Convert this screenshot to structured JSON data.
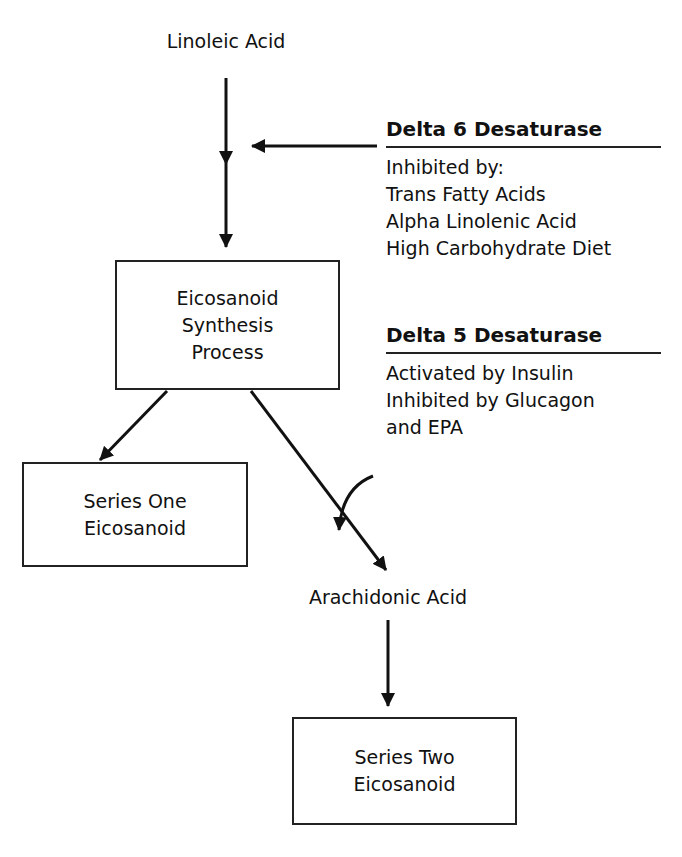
{
  "diagram": {
    "nodes": {
      "linoleic_acid": "Linoleic Acid",
      "synthesis": [
        "Eicosanoid",
        "Synthesis",
        "Process"
      ],
      "series_one": [
        "Series One",
        "Eicosanoid"
      ],
      "arachidonic_acid": "Arachidonic Acid",
      "series_two": [
        "Series Two",
        "Eicosanoid"
      ]
    },
    "enzymes": {
      "delta6": {
        "title": "Delta 6 Desaturase",
        "lines": [
          "Inhibited by:",
          "Trans Fatty Acids",
          "Alpha Linolenic Acid",
          "High Carbohydrate Diet"
        ]
      },
      "delta5": {
        "title": "Delta 5 Desaturase",
        "lines": [
          "Activated by Insulin",
          "Inhibited by Glucagon",
          "and EPA"
        ]
      }
    },
    "edges": [
      {
        "from": "Linoleic Acid",
        "to": "Eicosanoid Synthesis Process",
        "modifier": "Delta 6 Desaturase"
      },
      {
        "from": "Eicosanoid Synthesis Process",
        "to": "Series One Eicosanoid"
      },
      {
        "from": "Eicosanoid Synthesis Process",
        "to": "Arachidonic Acid",
        "modifier": "Delta 5 Desaturase"
      },
      {
        "from": "Arachidonic Acid",
        "to": "Series Two Eicosanoid"
      }
    ]
  }
}
